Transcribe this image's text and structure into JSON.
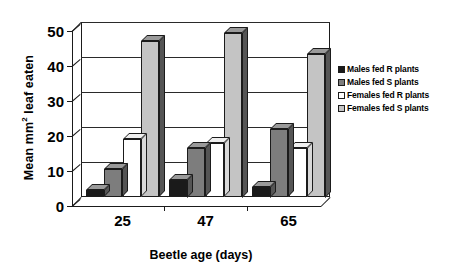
{
  "chart_data": {
    "type": "bar",
    "title": "",
    "xlabel": "Beetle age (days)",
    "ylabel": "Mean mm2 leaf eaten",
    "ylabel_prefix": "Mean mm",
    "ylabel_superscript": "2",
    "ylabel_suffix": " leaf eaten",
    "categories": [
      "25",
      "47",
      "65"
    ],
    "ylim": [
      0,
      50
    ],
    "yticks": [
      0,
      10,
      20,
      30,
      40,
      50
    ],
    "ytick_labels": [
      "0",
      "10",
      "20",
      "30",
      "40",
      "50"
    ],
    "grid": true,
    "grid_axis": "y",
    "legend_position": "right",
    "style": "3d-grouped-bars-grayscale",
    "series": [
      {
        "name": "Males fed R plants",
        "color": "#1a1a1a",
        "values": [
          2,
          5,
          3
        ]
      },
      {
        "name": "Males fed S plants",
        "color": "#7d7d7d",
        "values": [
          8,
          14,
          19.5
        ]
      },
      {
        "name": "Females fed R plants",
        "color": "#ffffff",
        "values": [
          16.5,
          15.5,
          14
        ]
      },
      {
        "name": "Females fed S plants",
        "color": "#c4c4c4",
        "values": [
          44.5,
          47,
          41
        ]
      }
    ]
  },
  "legend": {
    "items": [
      {
        "label": "Males fed R plants",
        "color": "#1a1a1a"
      },
      {
        "label": "Males fed S plants",
        "color": "#7d7d7d"
      },
      {
        "label": "Females fed R plants",
        "color": "#ffffff"
      },
      {
        "label": "Females fed S plants",
        "color": "#c4c4c4"
      }
    ]
  },
  "colors": {
    "axis": "#1b1b1b",
    "grid": "#2a2a2a",
    "background": "#ffffff",
    "bar_side_shade": "#555555",
    "bar_top_shade": "#9a9a9a"
  }
}
